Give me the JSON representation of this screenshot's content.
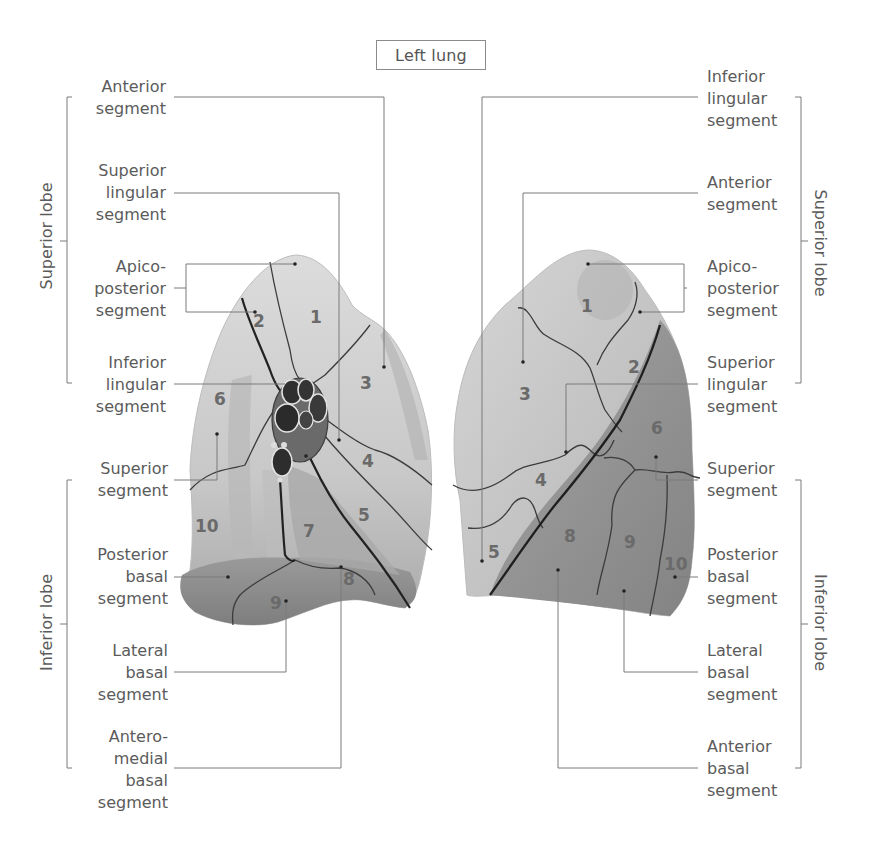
{
  "title": "Left lung",
  "colors": {
    "lung_light": "#d8d8d8",
    "lung_mid": "#b4b4b4",
    "lung_dark": "#8f8f8f",
    "fissure_line": "#2a2a2a",
    "segment_line": "#3e3e3e",
    "leader_line": "#777777",
    "text": "#5b5b5b"
  },
  "left_view": {
    "lobes": [
      {
        "label": "Superior lobe"
      },
      {
        "label": "Inferior lobe"
      }
    ],
    "labels": [
      {
        "id": "anterior",
        "text": "Anterior\nsegment"
      },
      {
        "id": "superior-lingular",
        "text": "Superior\nlingular\nsegment"
      },
      {
        "id": "apicoposterior",
        "text": "Apico-\nposterior\nsegment"
      },
      {
        "id": "inferior-lingular",
        "text": "Inferior\nlingular\nsegment"
      },
      {
        "id": "superior",
        "text": "Superior\nsegment"
      },
      {
        "id": "posterior-basal",
        "text": "Posterior\nbasal\nsegment"
      },
      {
        "id": "lateral-basal",
        "text": "Lateral\nbasal\nsegment"
      },
      {
        "id": "anteromedial-basal",
        "text": "Antero-\nmedial\nbasal\nsegment"
      }
    ],
    "segment_numbers": [
      "1",
      "2",
      "3",
      "4",
      "5",
      "6",
      "7",
      "8",
      "9",
      "10"
    ]
  },
  "right_view": {
    "lobes": [
      {
        "label": "Superior lobe"
      },
      {
        "label": "Inferior lobe"
      }
    ],
    "labels": [
      {
        "id": "inferior-lingular",
        "text": "Inferior\nlingular\nsegment"
      },
      {
        "id": "anterior",
        "text": "Anterior\nsegment"
      },
      {
        "id": "apicoposterior",
        "text": "Apico-\nposterior\nsegment"
      },
      {
        "id": "superior-lingular",
        "text": "Superior\nlingular\nsegment"
      },
      {
        "id": "superior",
        "text": "Superior\nsegment"
      },
      {
        "id": "posterior-basal",
        "text": "Posterior\nbasal\nsegment"
      },
      {
        "id": "lateral-basal",
        "text": "Lateral\nbasal\nsegment"
      },
      {
        "id": "anterior-basal",
        "text": "Anterior\nbasal\nsegment"
      }
    ],
    "segment_numbers": [
      "1",
      "2",
      "3",
      "4",
      "5",
      "6",
      "8",
      "9",
      "10"
    ]
  }
}
